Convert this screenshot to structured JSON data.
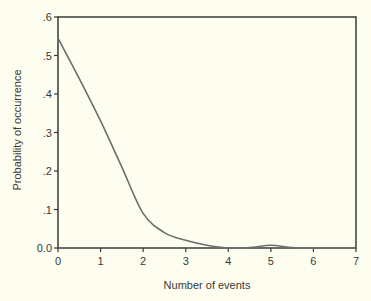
{
  "chart_data": {
    "type": "line",
    "title": "",
    "xlabel": "Number of events",
    "ylabel": "Probability of occurrence",
    "xlim": [
      0,
      7
    ],
    "ylim": [
      0,
      0.6
    ],
    "grid": false,
    "legend": null,
    "x_ticks": [
      "0",
      "1",
      "2",
      "3",
      "4",
      "5",
      "6",
      "7"
    ],
    "y_ticks": [
      "0.0",
      ".1",
      ".2",
      ".3",
      ".4",
      ".5",
      ".6"
    ],
    "series": [
      {
        "name": "probability",
        "color": "#6e6e6e",
        "x": [
          0,
          0.5,
          1.0,
          1.5,
          2.0,
          2.5,
          3.0,
          3.5,
          4.0,
          4.5,
          5.0,
          5.5,
          6.0,
          7.0
        ],
        "values": [
          0.545,
          0.44,
          0.33,
          0.21,
          0.09,
          0.04,
          0.02,
          0.007,
          0.0,
          0.001,
          0.007,
          0.001,
          0.0,
          0.0
        ]
      }
    ]
  },
  "colors": {
    "background": "#fdfdf0",
    "axis": "#3a3a3a",
    "line": "#6e6e6e"
  }
}
